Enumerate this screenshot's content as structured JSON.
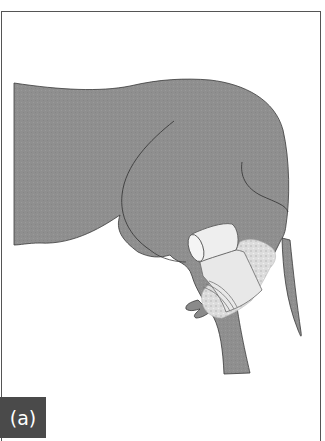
{
  "figure": {
    "panel_label": "(a)",
    "colors": {
      "background": "#ffffff",
      "frame_border": "#555555",
      "body_fill": "#8e8e8e",
      "outline": "#3a3a3a",
      "bandage_fill": "#e6e6e6",
      "padding_fill": "#d6d6d6",
      "label_bg": "#4a4a4a",
      "label_text": "#ffffff"
    }
  }
}
